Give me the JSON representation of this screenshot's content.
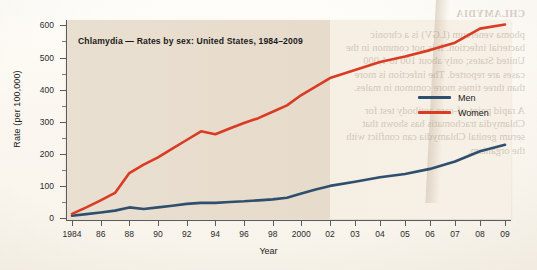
{
  "figure": {
    "title": "Chlamydia — Rates by sex: United States, 1984–2009",
    "x_axis_title": "Year",
    "y_axis_title": "Rate (per 100,000)"
  },
  "legend": {
    "position": "right-inside",
    "items": [
      {
        "label": "Men",
        "color": "#2e4f6e"
      },
      {
        "label": "Women",
        "color": "#d93b23"
      }
    ]
  },
  "axes": {
    "y_ticks": [
      "0",
      "100",
      "200",
      "300",
      "400",
      "500",
      "600"
    ],
    "y_minor_ticks": [
      "50",
      "150",
      "250",
      "350",
      "450",
      "550"
    ],
    "x_ticks": [
      "1984",
      "86",
      "88",
      "90",
      "92",
      "94",
      "96",
      "98",
      "2000",
      "02",
      "03",
      "04",
      "05",
      "06",
      "07",
      "08",
      "09"
    ]
  },
  "ghost_text": {
    "heading": "CHLAMYDIA",
    "paragraph_1": "phoma venereum (LGV) is a chronic bacterial infection. It is not common in the United States; only about 100 to 1,000 cases are reported. The infection is more than three times more common in males.",
    "paragraph_2": "A rapid point-of-care antibody test for Chlamydia trachomatis has shown that serum genital Chlamydia can conflict with the organism."
  },
  "colors": {
    "men_line": "#2e4f6e",
    "women_line": "#d93b23",
    "panel_left": "#e7dccc",
    "panel_right": "#f6efe4",
    "paper": "#fdfbf7",
    "axis": "#5c5c5c"
  },
  "chart_data": {
    "type": "line",
    "title": "Chlamydia — Rates by sex: United States, 1984–2009",
    "xlabel": "Year",
    "ylabel": "Rate (per 100,000)",
    "xlim": [
      1984,
      2009
    ],
    "ylim": [
      0,
      620
    ],
    "grid": false,
    "legend_position": "right-inside",
    "x": [
      1984,
      1985,
      1986,
      1987,
      1988,
      1989,
      1990,
      1991,
      1992,
      1993,
      1994,
      1995,
      1996,
      1997,
      1998,
      1999,
      2000,
      2001,
      2002,
      2003,
      2004,
      2005,
      2006,
      2007,
      2008,
      2009
    ],
    "series": [
      {
        "name": "Men",
        "color": "#2e4f6e",
        "values": [
          7,
          12,
          17,
          23,
          33,
          28,
          33,
          38,
          44,
          47,
          47,
          50,
          52,
          55,
          58,
          63,
          76,
          89,
          100,
          113,
          127,
          137,
          153,
          176,
          208,
          228
        ]
      },
      {
        "name": "Women",
        "color": "#d93b23",
        "values": [
          13,
          33,
          55,
          78,
          140,
          166,
          189,
          216,
          243,
          270,
          261,
          279,
          296,
          311,
          331,
          351,
          383,
          409,
          436,
          461,
          486,
          503,
          523,
          546,
          590,
          603
        ]
      }
    ],
    "annotations": [
      {
        "text": "Women rate plateaus 1993–1994 near 270 then dips to 261",
        "x": 1993.5,
        "y": 265
      }
    ]
  }
}
